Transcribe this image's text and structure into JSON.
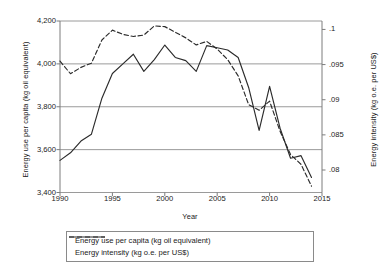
{
  "chart_data": {
    "type": "line",
    "title": "",
    "xlabel": "Year",
    "ylabel": "Energy use per capita (kg oil equivalent)",
    "ylabel_right": "Energy intensity (kg o.e. per US$)",
    "grid": true,
    "legend_position": "bottom",
    "xlim": [
      1990,
      2015
    ],
    "xticks": [
      1990,
      1995,
      2000,
      2005,
      2010,
      2015
    ],
    "xtick_labels": [
      "1990",
      "1995",
      "2000",
      "2005",
      "2010",
      "2015"
    ],
    "ylim": [
      3400,
      4200
    ],
    "yticks": [
      3400,
      3600,
      3800,
      4000,
      4200
    ],
    "ytick_labels": [
      "3,400",
      "3,600",
      "3,800",
      "4,000",
      "4,200"
    ],
    "ylim_right": [
      0.0768,
      0.1012
    ],
    "yticks_right": [
      0.08,
      0.085,
      0.09,
      0.095,
      0.1
    ],
    "ytick_labels_right": [
      ".08",
      ".085",
      ".09",
      ".095",
      ".1"
    ],
    "x": [
      1990,
      1991,
      1992,
      1993,
      1994,
      1995,
      1996,
      1997,
      1998,
      1999,
      2000,
      2001,
      2002,
      2003,
      2004,
      2005,
      2006,
      2007,
      2008,
      2009,
      2010,
      2011,
      2012,
      2013,
      2014
    ],
    "series": [
      {
        "name": "Energy use per capita (kg oil equivalent)",
        "axis": "left",
        "style": "solid",
        "color": "#2b2b2b",
        "values": [
          3550,
          3585,
          3640,
          3672,
          3840,
          3955,
          4000,
          4045,
          3965,
          4020,
          4088,
          4030,
          4015,
          3965,
          4085,
          4075,
          4065,
          4030,
          3890,
          3690,
          3895,
          3700,
          3560,
          3572,
          3470
        ]
      },
      {
        "name": "Energy intensity (kg o.e. per US$)",
        "axis": "right",
        "style": "dashed",
        "color": "#2b2b2b",
        "values": [
          0.0955,
          0.0937,
          0.0946,
          0.0952,
          0.0985,
          0.0999,
          0.0993,
          0.099,
          0.0992,
          0.1005,
          0.1004,
          0.0996,
          0.0988,
          0.0978,
          0.0983,
          0.0972,
          0.0957,
          0.0934,
          0.0893,
          0.0885,
          0.0898,
          0.0855,
          0.0822,
          0.0808,
          0.0777
        ]
      }
    ]
  },
  "legend": {
    "items": [
      {
        "label": "Energy use per capita (kg oil equivalent)",
        "style": "solid"
      },
      {
        "label": "Energy intensity (kg o.e. per US$)",
        "style": "dashed"
      }
    ]
  }
}
